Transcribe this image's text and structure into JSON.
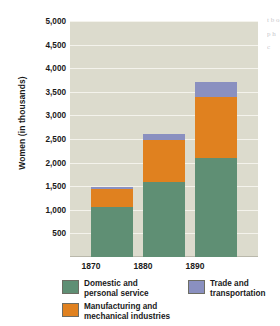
{
  "chart_data": {
    "type": "bar",
    "barmode": "stacked",
    "title": "",
    "xlabel": "",
    "ylabel": "Women (in thousands)",
    "categories": [
      "1870",
      "1880",
      "1890"
    ],
    "ylim": [
      0,
      5000
    ],
    "ytick_values": [
      500,
      1000,
      1500,
      2000,
      2500,
      3000,
      3500,
      4000,
      4500,
      5000
    ],
    "ytick_labels": [
      "500",
      "1,000",
      "1,500",
      "2,000",
      "2,500",
      "3,000",
      "3,500",
      "4,000",
      "4,500",
      "5,000"
    ],
    "grid": true,
    "legend_position": "bottom",
    "series": [
      {
        "name": "Domestic and\npersonal service",
        "color": "#5f8f74",
        "values": [
          1050,
          1580,
          2100
        ]
      },
      {
        "name": "Manufacturing and\nmechanical industries",
        "color": "#e0811f",
        "values": [
          400,
          900,
          1300
        ]
      },
      {
        "name": "Trade and\ntransportation",
        "color": "#8a90c0",
        "values": [
          30,
          120,
          300
        ]
      }
    ],
    "totals": [
      1480,
      2600,
      3700
    ]
  },
  "axes": {
    "y_title": "Women (in thousands)",
    "y_ticks": [
      "5,000",
      "4,500",
      "4,000",
      "3,500",
      "3,000",
      "2,500",
      "2,000",
      "1,500",
      "1,000",
      "500"
    ],
    "x_ticks": [
      "1870",
      "1880",
      "1890"
    ]
  },
  "legend": {
    "domestic_label": "Domestic and\npersonal service",
    "manufacturing_label": "Manufacturing and\nmechanical industries",
    "trade_label": "Trade and\ntransportation"
  },
  "colors": {
    "domestic": "#5f8f74",
    "manufacturing": "#e0811f",
    "trade": "#8a90c0",
    "plot_background": "#dcdbcd",
    "gridline": "#f4f3ec",
    "page_background": "#ffffff"
  },
  "margin_text": {
    "fragment": "t\nb\no\np\nh\nc"
  }
}
